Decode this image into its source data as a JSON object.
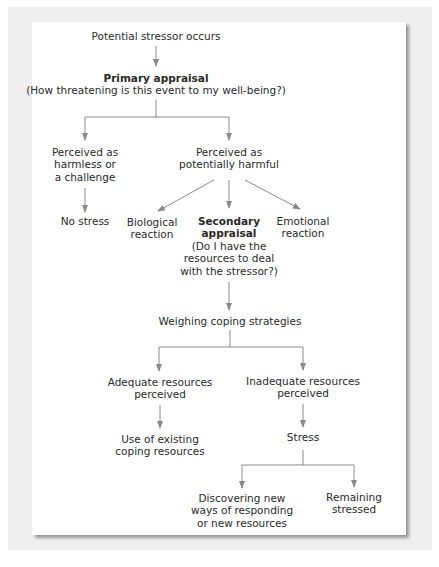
{
  "diagram": {
    "line_color": "#8a8a8a",
    "text_color": "#2a2a2a",
    "card_background": "#ffffff",
    "band_background": "#efefef",
    "nodes": {
      "stressor": {
        "lines": [
          "Potential stressor occurs"
        ]
      },
      "primary": {
        "title": "Primary appraisal",
        "lines": [
          "(How threatening is this event to my well-being?)"
        ]
      },
      "harmless": {
        "lines": [
          "Perceived as",
          "harmless or",
          "a challenge"
        ]
      },
      "harmful": {
        "lines": [
          "Perceived as",
          "potentially harmful"
        ]
      },
      "no_stress": {
        "lines": [
          "No stress"
        ]
      },
      "biological": {
        "lines": [
          "Biological",
          "reaction"
        ]
      },
      "secondary": {
        "title_lines": [
          "Secondary",
          "appraisal"
        ],
        "lines": [
          "(Do I have the",
          "resources to deal",
          "with the stressor?)"
        ]
      },
      "emotional": {
        "lines": [
          "Emotional",
          "reaction"
        ]
      },
      "weighing": {
        "lines": [
          "Weighing coping strategies"
        ]
      },
      "adequate": {
        "lines": [
          "Adequate resources",
          "perceived"
        ]
      },
      "inadequate": {
        "lines": [
          "Inadequate resources",
          "perceived"
        ]
      },
      "existing": {
        "lines": [
          "Use of existing",
          "coping resources"
        ]
      },
      "stress": {
        "lines": [
          "Stress"
        ]
      },
      "discovering": {
        "lines": [
          "Discovering new",
          "ways of responding",
          "or new resources"
        ]
      },
      "remaining": {
        "lines": [
          "Remaining",
          "stressed"
        ]
      }
    },
    "edges": [
      [
        "stressor",
        "primary"
      ],
      [
        "primary",
        "harmless"
      ],
      [
        "primary",
        "harmful"
      ],
      [
        "harmless",
        "no_stress"
      ],
      [
        "harmful",
        "biological"
      ],
      [
        "harmful",
        "secondary"
      ],
      [
        "harmful",
        "emotional"
      ],
      [
        "secondary",
        "weighing"
      ],
      [
        "weighing",
        "adequate"
      ],
      [
        "weighing",
        "inadequate"
      ],
      [
        "adequate",
        "existing"
      ],
      [
        "inadequate",
        "stress"
      ],
      [
        "stress",
        "discovering"
      ],
      [
        "stress",
        "remaining"
      ]
    ]
  }
}
